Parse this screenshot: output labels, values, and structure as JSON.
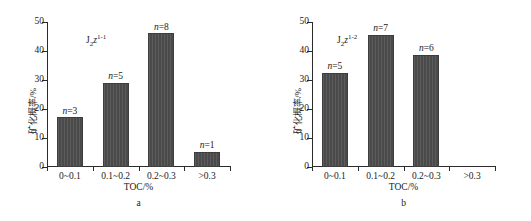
{
  "chart_data": [
    {
      "type": "bar",
      "panel": "a",
      "panel_label": "a",
      "series_tag": "J2z(1-1)",
      "series_tag_parts": {
        "main": "J",
        "sub": "2",
        "italic": "z",
        "sup": "1-1"
      },
      "title": "",
      "xlabel": "TOC/%",
      "ylabel": "矿化概率/%",
      "categories": [
        "0~0.1",
        "0.1~0.2",
        "0.2~0.3",
        ">0.3"
      ],
      "values": [
        17.2,
        29.1,
        46.2,
        5.2
      ],
      "point_labels": [
        "n=3",
        "n=5",
        "n=8",
        "n=1"
      ],
      "counts": [
        3,
        5,
        8,
        1
      ],
      "ylim": [
        0,
        50
      ],
      "yticks": [
        0,
        10,
        20,
        30,
        40,
        50
      ],
      "ytick_labels": [
        "0",
        "10",
        "20",
        "30",
        "40",
        "50"
      ],
      "grid": false,
      "legend": "none"
    },
    {
      "type": "bar",
      "panel": "b",
      "panel_label": "b",
      "series_tag": "J2z(1-2)",
      "series_tag_parts": {
        "main": "J",
        "sub": "2",
        "italic": "z",
        "sup": "1-2"
      },
      "title": "",
      "xlabel": "TOC/%",
      "ylabel": "矿化概率/%",
      "categories": [
        "0~0.1",
        "0.1~0.2",
        "0.2~0.3",
        ">0.3"
      ],
      "values": [
        32.5,
        45.6,
        38.7,
        0
      ],
      "point_labels": [
        "n=5",
        "n=7",
        "n=6",
        ""
      ],
      "counts": [
        5,
        7,
        6,
        0
      ],
      "ylim": [
        0,
        50
      ],
      "yticks": [
        0,
        10,
        20,
        30,
        40,
        50
      ],
      "ytick_labels": [
        "0",
        "10",
        "20",
        "30",
        "40",
        "50"
      ],
      "grid": false,
      "legend": "none"
    }
  ],
  "style": {
    "bar_color": "#4a4a4a",
    "axis_color": "#2b2b2b",
    "background": "#ffffff",
    "text_color": "#1a1a1a"
  }
}
